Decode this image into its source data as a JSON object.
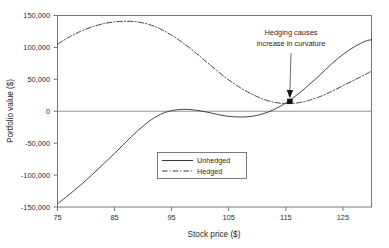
{
  "chart_data": {
    "type": "line",
    "title": "",
    "xlabel": "Stock price ($)",
    "ylabel": "Portfolio value ($)",
    "xlim": [
      75,
      130
    ],
    "ylim": [
      -150000,
      150000
    ],
    "xticks": [
      75,
      85,
      95,
      105,
      115,
      125
    ],
    "xtick_labels": [
      "75",
      "85",
      "95",
      "105",
      "115",
      "125"
    ],
    "yticks": [
      -150000,
      -100000,
      -50000,
      0,
      50000,
      100000,
      150000
    ],
    "ytick_labels": [
      "-150,000",
      "-100,000",
      "-50,000",
      "0",
      "50,000",
      "100,000",
      "150,000"
    ],
    "grid": false,
    "legend_position": "center",
    "zero_line": 0,
    "series": [
      {
        "name": "Unhedged",
        "style": "solid",
        "color": "#3b3b3b",
        "x": [
          75,
          77,
          79,
          81,
          83,
          85,
          87,
          89,
          91,
          93,
          95,
          97,
          99,
          101,
          103,
          105,
          107,
          109,
          111,
          113,
          115,
          117,
          119,
          121,
          123,
          125,
          127,
          129,
          130
        ],
        "y": [
          -145000,
          -131000,
          -116000,
          -100000,
          -83000,
          -66000,
          -48000,
          -31000,
          -16000,
          -5000,
          1000,
          3000,
          2000,
          -1000,
          -5000,
          -8000,
          -9000,
          -8000,
          -4000,
          3000,
          13000,
          26000,
          41000,
          57000,
          74000,
          89000,
          101000,
          110000,
          112000
        ]
      },
      {
        "name": "Hedged",
        "style": "dashdot",
        "color": "#3b3b3b",
        "x": [
          75,
          77,
          79,
          81,
          83,
          85,
          87,
          89,
          91,
          93,
          95,
          97,
          99,
          101,
          103,
          105,
          107,
          109,
          111,
          113,
          115,
          117,
          119,
          121,
          123,
          125,
          127,
          129,
          130
        ],
        "y": [
          105000,
          116000,
          125000,
          132000,
          137000,
          140000,
          141000,
          140000,
          136000,
          129000,
          119000,
          107000,
          93000,
          78000,
          63000,
          49000,
          37000,
          27000,
          19000,
          14000,
          12000,
          13000,
          17000,
          23000,
          31000,
          40000,
          49000,
          58000,
          63000
        ]
      }
    ],
    "annotations": [
      {
        "name": "curvature-note",
        "lines": [
          "Hedging causes",
          "increase in curvature"
        ],
        "arrow_to_x": 115.7,
        "arrow_to_y": 13000,
        "marker": true
      }
    ]
  },
  "legend": {
    "entries": [
      {
        "label": "Unhedged",
        "style": "solid"
      },
      {
        "label": "Hedged",
        "style": "dashdot"
      }
    ]
  }
}
